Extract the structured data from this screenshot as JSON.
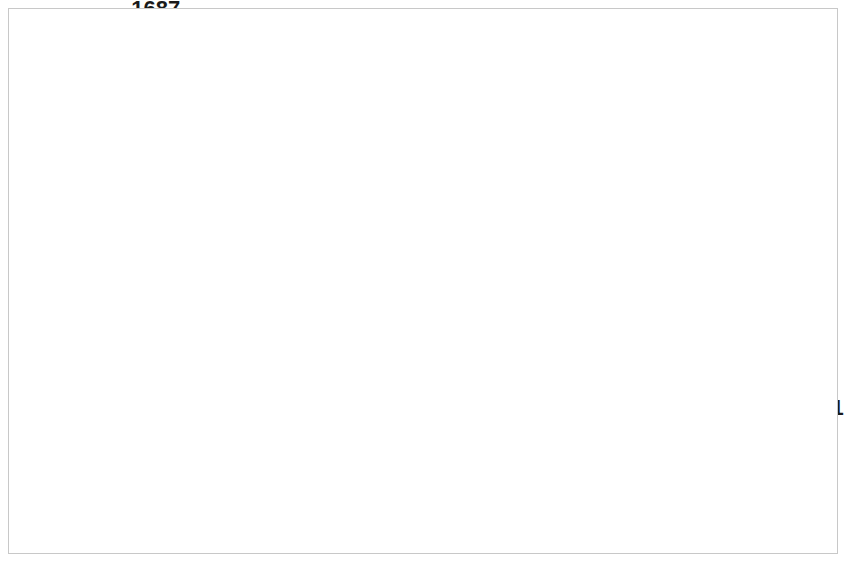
{
  "chart_data": {
    "type": "line",
    "title": "",
    "subtitle": "",
    "xlabel": "",
    "ylabel": "",
    "categories": [
      "2008",
      "2009",
      "2010",
      "2011",
      "2012",
      "2013",
      "2014",
      "2015",
      "2016",
      "2017",
      "2018",
      "2019",
      "2020",
      "2021"
    ],
    "series": [
      {
        "name": "Fuel costs (NZ$m)",
        "values": [
          1122,
          1687,
          939,
          1084,
          1219,
          1204,
          1120,
          1089,
          846,
          827,
          987,
          1271,
          1022,
          311
        ],
        "color": "#595959",
        "marker": "diamond"
      }
    ],
    "ylim": [
      300,
      1700
    ],
    "ytick_labels": [
      "300",
      "500",
      "700",
      "900",
      "1100",
      "1300",
      "1500",
      "1700"
    ],
    "ytick_values": [
      300,
      500,
      700,
      900,
      1100,
      1300,
      1500,
      1700
    ],
    "grid": true,
    "grid_color": "#a6a6a6",
    "legend": {
      "position": "bottom-center",
      "entries": [
        {
          "label": "Fuel costs (NZ$m)",
          "color": "#595959",
          "marker": "diamond"
        }
      ]
    },
    "data_labels": {
      "shown": true,
      "values": [
        "1122",
        "1687",
        "939",
        "1084",
        "1219",
        "1204",
        "1120",
        "1089",
        "846",
        "827",
        "987",
        "1271",
        "1022",
        "311"
      ]
    },
    "border_color": "#c8c8c8",
    "background": "#ffffff"
  }
}
